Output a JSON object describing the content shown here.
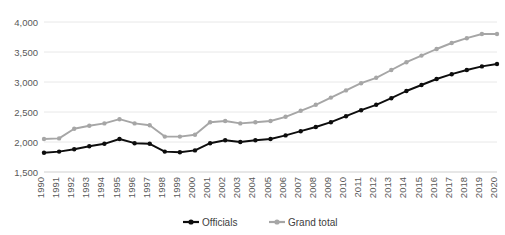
{
  "chart_data": {
    "type": "line",
    "title": "",
    "subtitle": "",
    "xlabel": "",
    "ylabel": "",
    "xlim": [
      1990,
      2020
    ],
    "ylim": [
      1500,
      4000
    ],
    "yticks": [
      "1,500",
      "2,000",
      "2,500",
      "3,000",
      "3,500",
      "4,000"
    ],
    "ytick_values": [
      1500,
      2000,
      2500,
      3000,
      3500,
      4000
    ],
    "grid": true,
    "legend_position": "bottom",
    "categories": [
      "1990",
      "1991",
      "1992",
      "1993",
      "1994",
      "1995",
      "1996",
      "1997",
      "1998",
      "1999",
      "2000",
      "2001",
      "2002",
      "2003",
      "2004",
      "2005",
      "2006",
      "2007",
      "2008",
      "2009",
      "2010",
      "2011",
      "2012",
      "2013",
      "2014",
      "2015",
      "2016",
      "2017",
      "2018",
      "2019",
      "2020"
    ],
    "series": [
      {
        "name": "Officials",
        "color": "#0d0d0d",
        "marker": "circle",
        "values": [
          1820,
          1840,
          1880,
          1930,
          1970,
          2050,
          1980,
          1970,
          1840,
          1830,
          1860,
          1980,
          2030,
          2000,
          2030,
          2050,
          2110,
          2180,
          2250,
          2330,
          2430,
          2530,
          2620,
          2730,
          2850,
          2950,
          3050,
          3130,
          3200,
          3260,
          3300
        ]
      },
      {
        "name": "Grand total",
        "color": "#a6a6a6",
        "marker": "circle",
        "values": [
          2050,
          2060,
          2220,
          2270,
          2310,
          2380,
          2310,
          2280,
          2090,
          2090,
          2120,
          2330,
          2350,
          2310,
          2330,
          2350,
          2420,
          2520,
          2620,
          2740,
          2860,
          2980,
          3070,
          3200,
          3330,
          3440,
          3550,
          3650,
          3730,
          3800,
          3800
        ]
      }
    ]
  },
  "legend": {
    "items": [
      {
        "label": "Officials"
      },
      {
        "label": "Grand total"
      }
    ]
  }
}
